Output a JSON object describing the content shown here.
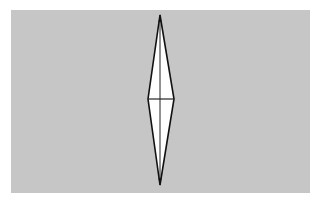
{
  "figure": {
    "background_color": "#c6c6c6",
    "shape_fill": "#ffffff",
    "stroke_color": "#111111",
    "shape": "elongated-diamond",
    "vertices": {
      "top": [
        160,
        15
      ],
      "left": [
        148,
        99
      ],
      "right": [
        174,
        99
      ],
      "bottom": [
        160,
        185
      ]
    },
    "lines": [
      "vertical-axis",
      "horizontal-axis"
    ]
  }
}
